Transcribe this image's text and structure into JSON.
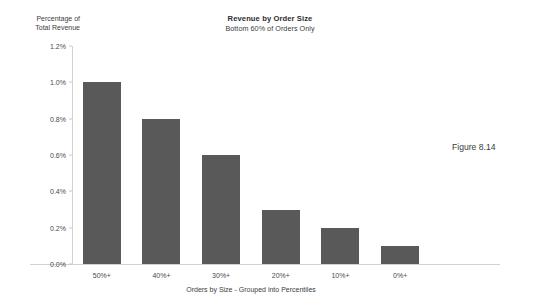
{
  "figure": {
    "caption": "Figure 8.14"
  },
  "chart_data": {
    "type": "bar",
    "title": "Revenue by Order Size",
    "subtitle": "Bottom 60% of Orders Only",
    "xlabel": "Orders by Size - Grouped into Percentiles",
    "ylabel": "Percentage of Total Revenue",
    "ylabel_line1": "Percentage of",
    "ylabel_line2": "Total Revenue",
    "categories": [
      "50%+",
      "40%+",
      "30%+",
      "20%+",
      "10%+",
      "0%+"
    ],
    "values": [
      1.0,
      0.8,
      0.6,
      0.3,
      0.2,
      0.1
    ],
    "value_labels": [
      "1.0%",
      "0.8%",
      "0.6%",
      "0.3%",
      "0.2%",
      "0.1%"
    ],
    "ylim": [
      0.0,
      1.2
    ],
    "ytick_values": [
      0.0,
      0.2,
      0.4,
      0.6,
      0.8,
      1.0,
      1.2
    ],
    "ytick_labels": [
      "0.0%",
      "0.2%",
      "0.4%",
      "0.6%",
      "0.8%",
      "1.0%",
      "1.2%"
    ],
    "grid": false,
    "legend": "none",
    "bar_color": "#595959",
    "axis_color": "#d2d2d2",
    "background_color": "#ffffff"
  }
}
